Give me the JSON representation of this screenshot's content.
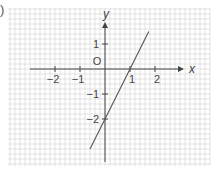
{
  "figure": {
    "panel_label": ")"
  },
  "chart_data": {
    "type": "line",
    "title": "",
    "xlabel": "x",
    "ylabel": "y",
    "origin_label": "O",
    "x_ticks": [
      {
        "value": -2,
        "label": "−2"
      },
      {
        "value": -1,
        "label": "−1"
      },
      {
        "value": 1,
        "label": "1"
      },
      {
        "value": 2,
        "label": "2"
      }
    ],
    "y_ticks": [
      {
        "value": 1,
        "label": "1"
      },
      {
        "value": -1,
        "label": "−1"
      },
      {
        "value": -2,
        "label": "−2"
      }
    ],
    "xlim": [
      -3.9,
      4.2
    ],
    "ylim": [
      -3.8,
      2.4
    ],
    "grid": true,
    "grid_minor_step": 0.2,
    "series": [
      {
        "name": "y = 2x - 2",
        "equation": "y = 2x - 2",
        "x": [
          -0.6,
          1.75
        ],
        "y": [
          -3.2,
          1.5
        ]
      }
    ],
    "colors": {
      "grid": "#d0d0d0",
      "axis": "#444444",
      "line": "#555555",
      "text": "#444444"
    }
  }
}
